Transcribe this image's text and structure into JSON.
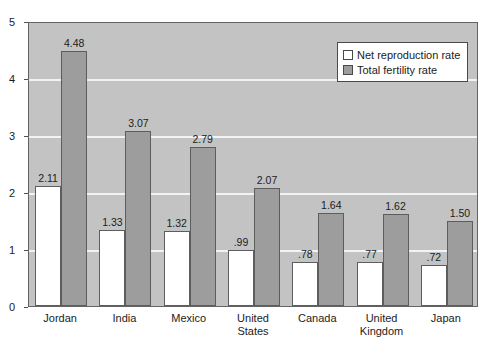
{
  "chart_data": {
    "type": "bar",
    "title": "",
    "subtitle": "",
    "xlabel": "",
    "ylabel": "",
    "ylim": [
      0,
      5
    ],
    "yticks": [
      0,
      1,
      2,
      3,
      4,
      5
    ],
    "ytick_labels": [
      "0",
      "1",
      "2",
      "3",
      "4",
      "5"
    ],
    "grid": true,
    "legend_position": "top-right",
    "categories": [
      "Jordan",
      "India",
      "Mexico",
      "United\nStates",
      "Canada",
      "United\nKingdom",
      "Japan"
    ],
    "series": [
      {
        "name": "Net reproduction rate",
        "color": "#ffffff",
        "values": [
          2.11,
          1.33,
          1.32,
          0.99,
          0.78,
          0.77,
          0.72
        ],
        "labels": [
          "2.11",
          "1.33",
          "1.32",
          ".99",
          ".78",
          ".77",
          ".72"
        ]
      },
      {
        "name": "Total fertility rate",
        "color": "#9d9d9d",
        "values": [
          4.48,
          3.07,
          2.79,
          2.07,
          1.64,
          1.62,
          1.5
        ],
        "labels": [
          "4.48",
          "3.07",
          "2.79",
          "2.07",
          "1.64",
          "1.62",
          "1.50"
        ]
      }
    ]
  },
  "colors": {
    "plot_background": "#c3c3c3",
    "gridline": "#f3f3f3",
    "axis": "#646464",
    "bar_border": "#5d5d5d",
    "text": "#1c1c1c",
    "page_background": "#ffffff"
  }
}
